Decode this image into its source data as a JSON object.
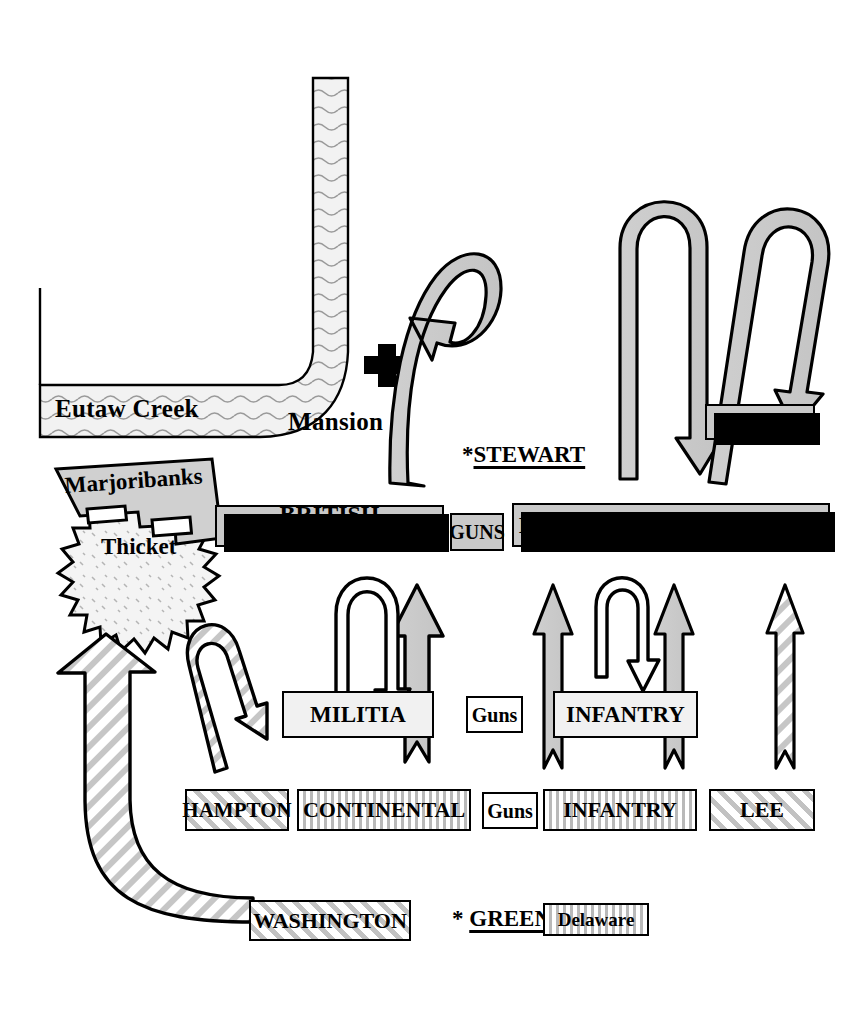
{
  "map": {
    "title": "Battle of Eutaw Springs",
    "terrain": [
      {
        "name": "creek",
        "label": "Eutaw Creek"
      },
      {
        "name": "mansion",
        "label": "Mansion"
      },
      {
        "name": "thicket",
        "label": "Thicket"
      },
      {
        "name": "marjoribanks",
        "label": "Marjoribanks"
      }
    ],
    "commanders": [
      {
        "name": "stewart",
        "label": "*STEWART",
        "side": "british"
      },
      {
        "name": "greene",
        "label": "* GREENE",
        "side": "american"
      }
    ],
    "british_units": [
      {
        "name": "coffin",
        "label": "COFFIN"
      },
      {
        "name": "british-infantry",
        "label": "BRITISH INFANTRY"
      },
      {
        "name": "guns-british",
        "label": "GUNS"
      },
      {
        "name": "loyalist-british",
        "label": "LOYALIST & BRITISH INF."
      }
    ],
    "american_front_line": [
      {
        "name": "militia",
        "label": "MILITIA"
      },
      {
        "name": "guns-center",
        "label": "Guns"
      },
      {
        "name": "infantry-front",
        "label": "INFANTRY"
      }
    ],
    "american_second_line": [
      {
        "name": "hampton",
        "label": "HAMPTON"
      },
      {
        "name": "continental",
        "label": "CONTINENTAL"
      },
      {
        "name": "guns-second",
        "label": "Guns"
      },
      {
        "name": "infantry-second",
        "label": "INFANTRY"
      },
      {
        "name": "lee",
        "label": "LEE"
      }
    ],
    "american_reserve": [
      {
        "name": "washington",
        "label": "WASHINGTON"
      },
      {
        "name": "delaware",
        "label": "Delaware"
      }
    ],
    "colors": {
      "ink": "#000000",
      "british_fill": "#c9c9c9",
      "water_fill": "#ececec",
      "arrow_gray": "#c9c9c9",
      "paper": "#ffffff"
    }
  },
  "icons": {
    "mansion": "cross-building-icon",
    "creek": "water-band-icon",
    "thicket": "spiky-thicket-icon",
    "british_advance": "hook-arrow-icon",
    "american_advance": "straight-arrow-icon",
    "cavalry_sweep": "hatched-curved-arrow-icon"
  }
}
